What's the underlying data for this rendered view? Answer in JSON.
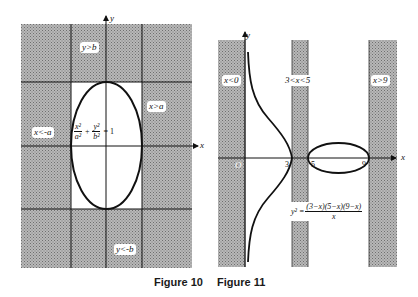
{
  "figure10": {
    "caption": "Figure 10",
    "labels": {
      "y_axis": "y",
      "x_axis": "x",
      "top_region": "y>b",
      "bottom_region": "y<-b",
      "left_region": "x<-a",
      "right_region": "x>a"
    },
    "equation": {
      "term1_num": "x²",
      "term1_den": "a²",
      "plus": "+",
      "term2_num": "y²",
      "term2_den": "b²",
      "rhs": "= 1"
    },
    "colors": {
      "shade": "#9a9a9a",
      "line": "#111111"
    }
  },
  "figure11": {
    "caption": "Figure 11",
    "labels": {
      "y_axis": "y",
      "x_axis": "x",
      "left_region": "x<0",
      "middle_region": "3<x<5",
      "right_region": "x>9",
      "origin": "O",
      "tick_3": "3",
      "tick_5": "5",
      "tick_9": "9"
    },
    "equation": {
      "lhs": "y² =",
      "numerator": "(3−x)(5−x)(9−x)",
      "denominator": "x"
    }
  }
}
